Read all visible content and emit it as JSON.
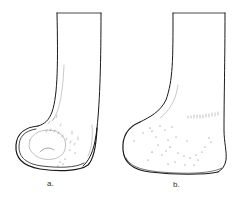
{
  "figure": {
    "panels": [
      {
        "id": "a",
        "label": "a."
      },
      {
        "id": "b",
        "label": "b."
      }
    ],
    "colors": {
      "line": "#1a1a1a",
      "stipple": "#555555",
      "background": "#ffffff"
    }
  }
}
